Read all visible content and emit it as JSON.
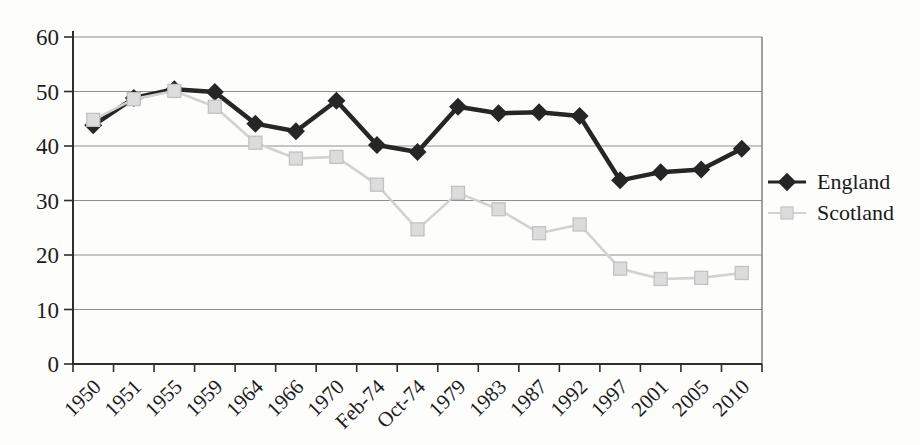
{
  "chart_data": {
    "type": "line",
    "title": "",
    "xlabel": "",
    "ylabel": "",
    "categories": [
      "1950",
      "1951",
      "1955",
      "1959",
      "1964",
      "1966",
      "1970",
      "Feb-74",
      "Oct-74",
      "1979",
      "1983",
      "1987",
      "1992",
      "1997",
      "2001",
      "2005",
      "2010"
    ],
    "series": [
      {
        "name": "England",
        "marker": "diamond",
        "color": "#262626",
        "line_color": "#262626",
        "values": [
          43.8,
          48.8,
          50.4,
          49.9,
          44.1,
          42.7,
          48.3,
          40.2,
          38.9,
          47.2,
          46.0,
          46.2,
          45.5,
          33.7,
          35.2,
          35.7,
          39.5
        ]
      },
      {
        "name": "Scotland",
        "marker": "square",
        "color": "#dcdcdc",
        "marker_edge": "#c2c2c2",
        "line_color": "#d2d2d2",
        "values": [
          44.8,
          48.6,
          50.1,
          47.2,
          40.6,
          37.7,
          38.0,
          32.9,
          24.7,
          31.4,
          28.4,
          24.0,
          25.6,
          17.5,
          15.6,
          15.8,
          16.7
        ]
      }
    ],
    "ylim": [
      0,
      60
    ],
    "yticks": [
      0,
      10,
      20,
      30,
      40,
      50,
      60
    ],
    "grid": "horizontal",
    "legend_position": "right-middle",
    "axis_color": "#2e2e2e",
    "gridline_color": "#8f8f8f",
    "border_color": "#707070",
    "tick_label_color": "#1c1c1c"
  }
}
